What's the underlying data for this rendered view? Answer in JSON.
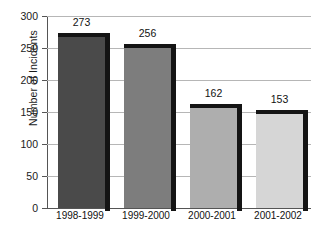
{
  "chart_data": {
    "type": "bar",
    "title": "",
    "xlabel": "",
    "ylabel": "Number of Incidents",
    "categories": [
      "1998-1999",
      "1999-2000",
      "2000-2001",
      "2001-2002"
    ],
    "values": [
      273,
      256,
      162,
      153
    ],
    "ylim": [
      0,
      300
    ],
    "yticks": [
      0,
      50,
      100,
      150,
      200,
      250,
      300
    ],
    "ytick_labels": [
      "0",
      "50",
      "100",
      "150",
      "200",
      "250",
      "300"
    ],
    "grid": true,
    "legend": "none",
    "bar_colors": [
      "#4a4a4a",
      "#7d7d7d",
      "#aeaeae",
      "#d6d6d6"
    ],
    "bar_shadow_color": "#141414",
    "gridline_color": "#b6b6b6",
    "axis_color": "#555555",
    "background_color": "#ffffff",
    "data_labels": [
      "273",
      "256",
      "162",
      "153"
    ]
  },
  "axis": {
    "y_title": "Number of Incidents"
  },
  "footnote": {
    "text": ""
  }
}
